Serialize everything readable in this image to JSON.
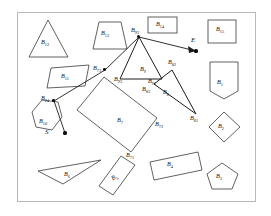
{
  "figure": {
    "type": "path-planning-obstacle-diagram",
    "background": "#ffffff",
    "border_color": "#b9b9b9",
    "obstacle_stroke": "#3a3a3a",
    "path_stroke": "#1c1c1c"
  },
  "points": [
    {
      "id": "S",
      "label": "S",
      "label_x": 45,
      "label_y": 133,
      "dot_x": 65,
      "dot_y": 133
    },
    {
      "id": "E",
      "label": "E",
      "label_x": 191,
      "label_y": 41,
      "dot_x": 196,
      "dot_y": 51
    }
  ],
  "path_vertices": [
    {
      "label": "B",
      "sub": "24",
      "x": 52,
      "y": 99
    },
    {
      "label": "B",
      "sub": "73",
      "x": 104,
      "y": 68
    },
    {
      "label": "B",
      "sub": "92",
      "x": 139,
      "y": 36
    },
    {
      "label": "B",
      "sub": "93",
      "x": 122,
      "y": 74
    },
    {
      "label": "B",
      "sub": "91",
      "x": 155,
      "y": 77
    },
    {
      "label": "B",
      "sub": "82",
      "x": 174,
      "y": 63
    },
    {
      "label": "B",
      "sub": "83",
      "x": 149,
      "y": 88
    },
    {
      "label": "B",
      "sub": "81",
      "x": 196,
      "y": 116
    },
    {
      "label": "B",
      "sub": "71",
      "x": 132,
      "y": 155
    },
    {
      "label": "B",
      "sub": "72",
      "x": 160,
      "y": 124
    }
  ],
  "obstacles": [
    {
      "label": "B",
      "sub": "1",
      "shape": "home-plate-pentagon",
      "label_x": 223,
      "label_y": 83
    },
    {
      "label": "B",
      "sub": "2",
      "shape": "diamond",
      "label_x": 224,
      "label_y": 127
    },
    {
      "label": "B",
      "sub": "3",
      "shape": "pentagon",
      "label_x": 222,
      "label_y": 177
    },
    {
      "label": "B",
      "sub": "4",
      "shape": "tilted-rectangle",
      "label_x": 172,
      "label_y": 165
    },
    {
      "label": "B",
      "sub": "5",
      "shape": "tilted-rectangle",
      "label_x": 117,
      "label_y": 178
    },
    {
      "label": "B",
      "sub": "6",
      "shape": "thin-triangle",
      "label_x": 70,
      "label_y": 175
    },
    {
      "label": "B",
      "sub": "7",
      "shape": "tilted-rectangle",
      "label_x": 122,
      "label_y": 121
    },
    {
      "label": "B",
      "sub": "8",
      "shape": "triangle",
      "label_x": 167,
      "label_y": 93
    },
    {
      "label": "B",
      "sub": "9",
      "shape": "triangle",
      "label_x": 144,
      "label_y": 70
    },
    {
      "label": "B",
      "sub": "10",
      "shape": "hexagon",
      "label_x": 45,
      "label_y": 122
    },
    {
      "label": "B",
      "sub": "11",
      "shape": "parallelogram",
      "label_x": 67,
      "label_y": 77
    },
    {
      "label": "B",
      "sub": "12",
      "shape": "triangle",
      "label_x": 47,
      "label_y": 43
    },
    {
      "label": "B",
      "sub": "13",
      "shape": "trapezoid",
      "label_x": 106,
      "label_y": 34
    },
    {
      "label": "B",
      "sub": "14",
      "shape": "rectangle",
      "label_x": 160,
      "label_y": 26
    },
    {
      "label": "B",
      "sub": "15",
      "shape": "rectangle",
      "label_x": 222,
      "label_y": 30
    }
  ]
}
